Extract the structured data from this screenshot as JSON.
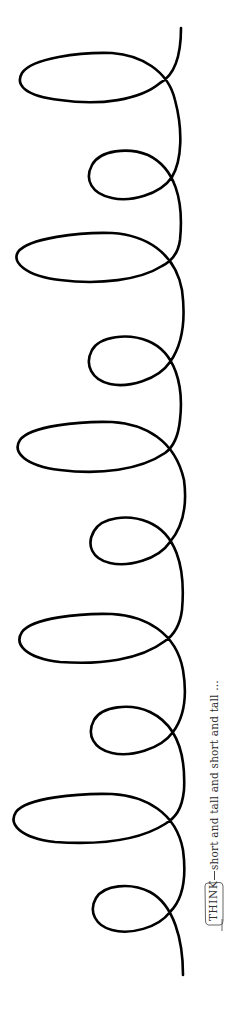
{
  "figure": {
    "stroke_color": "#000000",
    "background": "#ffffff",
    "stroke_width": 2.6
  },
  "label": {
    "tag": "THINK",
    "caption": "short and tall and short and tall …"
  },
  "loops": [
    {
      "kind": "tall",
      "cy": 80
    },
    {
      "kind": "short",
      "cy": 176
    },
    {
      "kind": "tall",
      "cy": 265
    },
    {
      "kind": "short",
      "cy": 362
    },
    {
      "kind": "tall",
      "cy": 452
    },
    {
      "kind": "short",
      "cy": 542
    },
    {
      "kind": "tall",
      "cy": 640
    },
    {
      "kind": "short",
      "cy": 732
    },
    {
      "kind": "tall",
      "cy": 822
    },
    {
      "kind": "short",
      "cy": 915
    }
  ]
}
